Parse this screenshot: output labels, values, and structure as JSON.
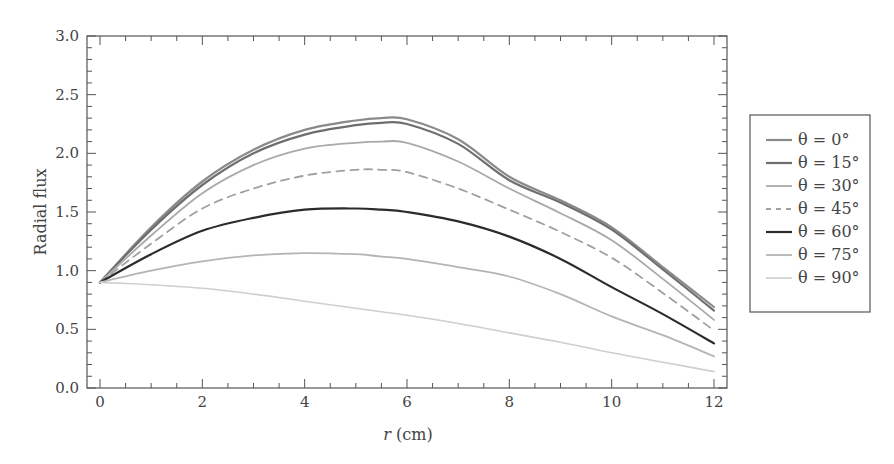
{
  "chart_data": {
    "type": "line",
    "title": "",
    "xlabel_italic": "r",
    "xlabel_rest": " (cm)",
    "xlabel": "r (cm)",
    "ylabel": "Radial flux",
    "xlim": [
      -0.25,
      12.25
    ],
    "ylim": [
      0.0,
      3.0
    ],
    "xticks": [
      0,
      2,
      4,
      6,
      8,
      10,
      12
    ],
    "xtick_labels": [
      "0",
      "2",
      "4",
      "6",
      "8",
      "10",
      "12"
    ],
    "yticks": [
      0.0,
      0.5,
      1.0,
      1.5,
      2.0,
      2.5,
      3.0
    ],
    "ytick_labels": [
      "0.0",
      "0.5",
      "1.0",
      "1.5",
      "2.0",
      "2.5",
      "3.0"
    ],
    "grid": false,
    "legend_position": "outside-right",
    "x": [
      0,
      1,
      2,
      3,
      4,
      5,
      5.5,
      6,
      7,
      8,
      9,
      10,
      11,
      12
    ],
    "series": [
      {
        "name": "θ = 0°",
        "color": "#8a8a8a",
        "width": 2.2,
        "dash": "",
        "values": [
          0.9,
          1.37,
          1.76,
          2.03,
          2.2,
          2.28,
          2.3,
          2.29,
          2.12,
          1.8,
          1.6,
          1.37,
          1.03,
          0.69
        ]
      },
      {
        "name": "θ = 15°",
        "color": "#6e6e6e",
        "width": 2.2,
        "dash": "",
        "values": [
          0.9,
          1.35,
          1.73,
          2.0,
          2.16,
          2.24,
          2.26,
          2.25,
          2.08,
          1.77,
          1.58,
          1.35,
          1.01,
          0.66
        ]
      },
      {
        "name": "θ = 30°",
        "color": "#a9a9a9",
        "width": 1.8,
        "dash": "",
        "values": [
          0.9,
          1.3,
          1.66,
          1.9,
          2.04,
          2.09,
          2.1,
          2.09,
          1.93,
          1.7,
          1.49,
          1.26,
          0.93,
          0.58
        ]
      },
      {
        "name": "θ = 45°",
        "color": "#a0a0a0",
        "width": 1.8,
        "dash": "8,6",
        "values": [
          0.9,
          1.23,
          1.53,
          1.7,
          1.81,
          1.86,
          1.86,
          1.84,
          1.7,
          1.52,
          1.33,
          1.11,
          0.81,
          0.49
        ]
      },
      {
        "name": "θ = 60°",
        "color": "#2b2b2b",
        "width": 2.2,
        "dash": "",
        "values": [
          0.9,
          1.14,
          1.34,
          1.45,
          1.52,
          1.53,
          1.52,
          1.5,
          1.42,
          1.29,
          1.1,
          0.86,
          0.63,
          0.38
        ]
      },
      {
        "name": "θ = 75°",
        "color": "#b4b4b4",
        "width": 1.8,
        "dash": "",
        "values": [
          0.9,
          1.0,
          1.08,
          1.13,
          1.15,
          1.14,
          1.12,
          1.1,
          1.03,
          0.95,
          0.8,
          0.61,
          0.45,
          0.27
        ]
      },
      {
        "name": "θ = 90°",
        "color": "#cfcfcf",
        "width": 1.6,
        "dash": "",
        "values": [
          0.9,
          0.88,
          0.85,
          0.8,
          0.74,
          0.68,
          0.65,
          0.62,
          0.55,
          0.47,
          0.39,
          0.3,
          0.22,
          0.14
        ]
      }
    ]
  },
  "legend": {
    "items": [
      {
        "label": "θ = 0°"
      },
      {
        "label": "θ = 15°"
      },
      {
        "label": "θ = 30°"
      },
      {
        "label": "θ = 45°"
      },
      {
        "label": "θ = 60°"
      },
      {
        "label": "θ = 75°"
      },
      {
        "label": "θ = 90°"
      }
    ]
  }
}
